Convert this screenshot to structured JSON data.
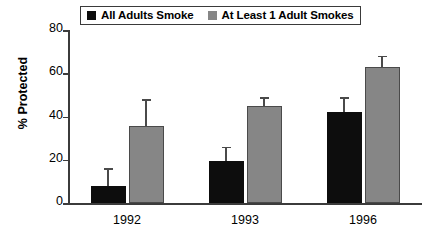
{
  "chart_data": {
    "type": "bar",
    "title": "",
    "xlabel": "",
    "ylabel": "% Protected",
    "ylim": [
      0,
      80
    ],
    "yticks": [
      0,
      20,
      40,
      60,
      80
    ],
    "ytick_labels": [
      "0",
      "20",
      "40",
      "60",
      "80"
    ],
    "grid": false,
    "legend_position": "top-center",
    "categories": [
      "1992",
      "1993",
      "1996"
    ],
    "series": [
      {
        "name": "All Adults Smoke",
        "color": "#0d0d0d",
        "values": [
          8,
          19.5,
          42
        ],
        "error_upper": [
          16,
          26,
          49
        ]
      },
      {
        "name": "At Least 1 Adult Smokes",
        "color": "#868686",
        "values": [
          35.5,
          45,
          63
        ],
        "error_upper": [
          48,
          49,
          68
        ]
      }
    ]
  },
  "legend": {
    "entries": [
      {
        "label": "All Adults Smoke",
        "swatch": "black-swatch-icon"
      },
      {
        "label": "At Least 1 Adult Smokes",
        "swatch": "gray-swatch-icon"
      }
    ]
  },
  "axis": {
    "y_title": "% Protected",
    "y_ticks": [
      "80",
      "60",
      "40",
      "20",
      "0"
    ],
    "x_categories": [
      "1992",
      "1993",
      "1996"
    ]
  }
}
